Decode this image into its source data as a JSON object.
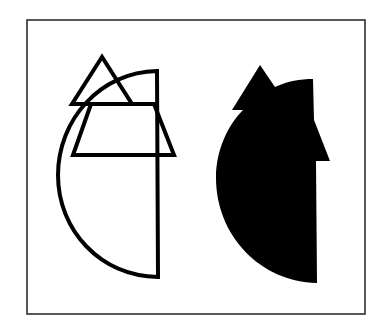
{
  "figure": {
    "frame": {
      "x": 27,
      "y": 20,
      "width": 338,
      "height": 294,
      "stroke": "#222222"
    },
    "left_outline": {
      "description": "Outlined composite: half-disc, small triangle, and trapezoid overlapping",
      "stroke": "#000000",
      "stroke_width": 4
    },
    "right_silhouette": {
      "description": "Filled black silhouette of the combined shapes",
      "fill": "#000000"
    }
  }
}
